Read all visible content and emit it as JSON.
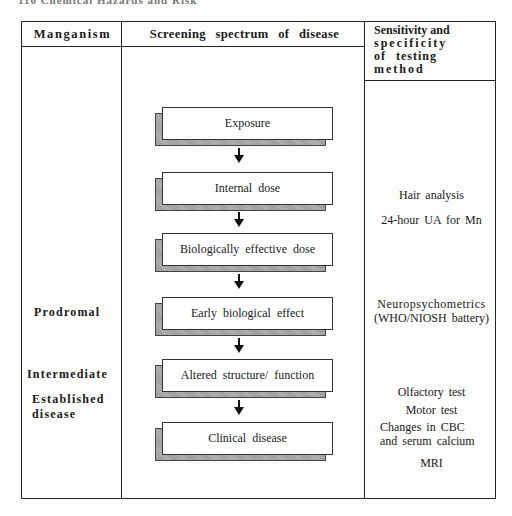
{
  "running_header": "116  Chemical Hazards and Risk",
  "table": {
    "headers": {
      "col1": "Manganism",
      "col2": "Screening spectrum of disease",
      "col3_lines": [
        "Sensitivity and",
        "specificity",
        "of testing",
        "method"
      ]
    },
    "stages": [
      {
        "label_lines": [
          "Prodromal"
        ]
      },
      {
        "label_lines": [
          "Intermediate"
        ]
      },
      {
        "label_lines": [
          "Established",
          "disease"
        ]
      }
    ],
    "spectrum_steps": [
      "Exposure",
      "Internal dose",
      "Biologically effective dose",
      "Early biological effect",
      "Altered structure/ function",
      "Clinical disease"
    ],
    "methods": [
      {
        "lines": [
          "Hair analysis"
        ]
      },
      {
        "lines": [
          "24-hour UA for Mn"
        ]
      },
      {
        "lines": [
          "Neuropsychometrics",
          "(WHO/NIOSH battery)"
        ]
      },
      {
        "lines": [
          "Olfactory test"
        ]
      },
      {
        "lines": [
          "Motor test"
        ]
      },
      {
        "lines": [
          "Changes in CBC",
          "and serum calcium"
        ]
      },
      {
        "lines": [
          "MRI"
        ]
      }
    ]
  }
}
